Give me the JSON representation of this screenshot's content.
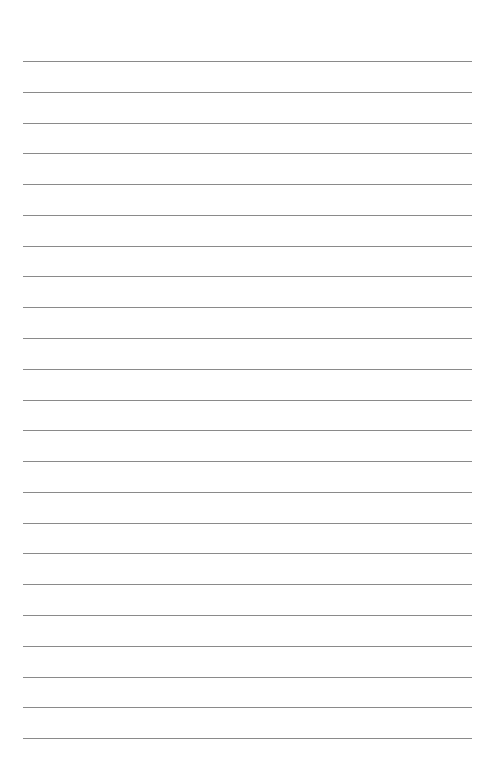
{
  "page": {
    "type": "lined-paper",
    "line_color": "#8a8a8a",
    "background": "#ffffff",
    "line_count": 23,
    "first_line_y": 61,
    "line_spacing": 30.78,
    "lines": [
      "",
      "",
      "",
      "",
      "",
      "",
      "",
      "",
      "",
      "",
      "",
      "",
      "",
      "",
      "",
      "",
      "",
      "",
      "",
      "",
      "",
      "",
      ""
    ]
  }
}
